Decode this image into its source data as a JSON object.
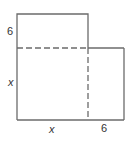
{
  "diagram": {
    "type": "geometric-figure",
    "colors": {
      "stroke": "#6b6b6b",
      "label": "#333333",
      "background": "#ffffff"
    },
    "labels": {
      "left_top": "6",
      "left_middle": "x",
      "bottom_left": "x",
      "bottom_right": "6"
    }
  }
}
